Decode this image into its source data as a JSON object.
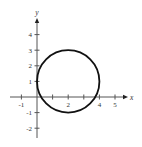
{
  "chart_data": {
    "type": "line",
    "title": "",
    "xlabel": "x",
    "ylabel": "y",
    "xlim": [
      -1.7,
      5.8
    ],
    "ylim": [
      -2.6,
      4.9
    ],
    "grid": false,
    "legend": null,
    "x_ticks": [
      -1,
      1,
      2,
      3,
      4,
      5
    ],
    "x_tick_labels": [
      {
        "value": -1,
        "label": "-1"
      },
      {
        "value": 2,
        "label": "2"
      },
      {
        "value": 4,
        "label": "4"
      },
      {
        "value": 5,
        "label": "5"
      }
    ],
    "y_ticks": [
      -2,
      -1,
      1,
      2,
      3,
      4
    ],
    "y_tick_labels": [
      {
        "value": -2,
        "label": "-2"
      },
      {
        "value": -1,
        "label": "-1"
      },
      {
        "value": 1,
        "label": "1"
      },
      {
        "value": 2,
        "label": "2"
      },
      {
        "value": 3,
        "label": "3"
      },
      {
        "value": 4,
        "label": "4"
      }
    ],
    "series": [
      {
        "name": "circle",
        "shape": "circle",
        "center": [
          2,
          1
        ],
        "radius": 2,
        "equation": "(x - 2)^2 + (y - 1)^2 = 4",
        "color": "#111111"
      }
    ]
  },
  "style": {
    "axis_color": "#555555",
    "curve_color": "#111111",
    "background": "#ffffff"
  }
}
